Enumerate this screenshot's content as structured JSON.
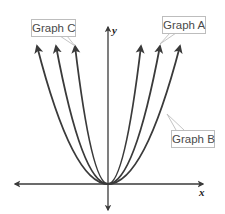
{
  "diagram": {
    "type": "function-graphs",
    "axes": {
      "x_label": "x",
      "y_label": "y"
    },
    "callouts": [
      {
        "id": "graph-a",
        "label": "Graph A"
      },
      {
        "id": "graph-b",
        "label": "Graph B"
      },
      {
        "id": "graph-c",
        "label": "Graph C"
      }
    ],
    "colors": {
      "curve": "#3a3a3a",
      "axis": "#3a3a3a",
      "callout_border": "#bdbdbd",
      "callout_text": "#4a4a4a"
    }
  }
}
